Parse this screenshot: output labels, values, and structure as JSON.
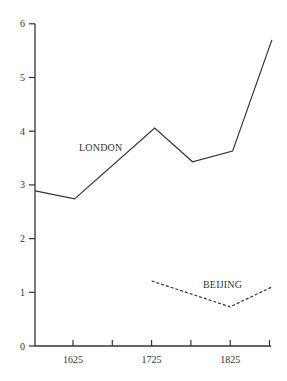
{
  "chart_data": {
    "type": "line",
    "title": "",
    "xlabel": "",
    "ylabel": "",
    "xlim": [
      1575,
      1880
    ],
    "ylim": [
      0,
      6
    ],
    "grid": false,
    "legend": "inline labels",
    "x_ticks": [
      1625,
      1675,
      1725,
      1775,
      1825,
      1875
    ],
    "x_tick_labels": [
      "1625",
      "",
      "1725",
      "",
      "1825",
      ""
    ],
    "y_ticks": [
      0,
      1,
      2,
      3,
      4,
      5,
      6
    ],
    "y_tick_labels": [
      "0",
      "1",
      "2",
      "3",
      "4",
      "5",
      "6"
    ],
    "series": [
      {
        "name": "LONDON",
        "style": "solid",
        "color": "#333333",
        "x": [
          1577,
          1627,
          1729,
          1777,
          1828,
          1878
        ],
        "values": [
          2.89,
          2.74,
          4.06,
          3.43,
          3.63,
          5.7
        ]
      },
      {
        "name": "BEIJING",
        "style": "dashed",
        "color": "#333333",
        "x": [
          1725,
          1825,
          1880
        ],
        "values": [
          1.21,
          0.73,
          1.1
        ]
      }
    ],
    "annotations": [
      {
        "text": "LONDON",
        "x": 1632,
        "y": 3.7
      },
      {
        "text": "BEIJING",
        "x": 1790,
        "y": 1.12
      }
    ]
  },
  "labels": {
    "london": "LONDON",
    "beijing": "BEIJING"
  }
}
